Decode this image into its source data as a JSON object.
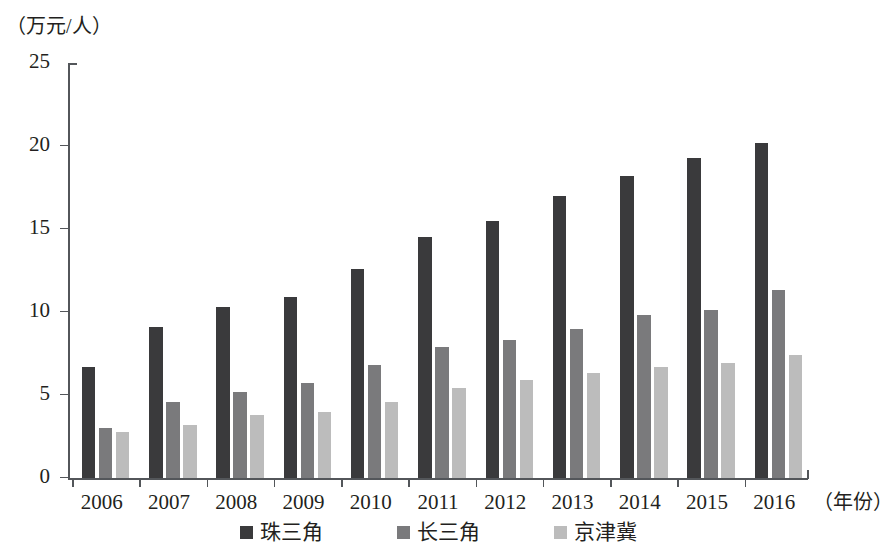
{
  "chart_data": {
    "type": "bar",
    "title": "",
    "xlabel": "（年份）",
    "ylabel": "（万元/人）",
    "categories": [
      "2006",
      "2007",
      "2008",
      "2009",
      "2010",
      "2011",
      "2012",
      "2013",
      "2014",
      "2015",
      "2016"
    ],
    "series": [
      {
        "name": "珠三角",
        "color": "#3a3a3c",
        "values": [
          6.7,
          9.1,
          10.3,
          10.9,
          12.6,
          14.5,
          15.5,
          17.0,
          18.2,
          19.3,
          20.2
        ]
      },
      {
        "name": "长三角",
        "color": "#7a7a7c",
        "values": [
          3.0,
          4.6,
          5.2,
          5.7,
          6.8,
          7.9,
          8.3,
          9.0,
          9.8,
          10.1,
          11.3
        ]
      },
      {
        "name": "京津冀",
        "color": "#bcbcbc",
        "values": [
          2.8,
          3.2,
          3.8,
          4.0,
          4.6,
          5.4,
          5.9,
          6.3,
          6.7,
          6.9,
          7.4
        ]
      }
    ],
    "yticks": [
      0,
      5,
      10,
      15,
      20,
      25
    ],
    "ylim": [
      0,
      25
    ],
    "grid": false,
    "legend_position": "bottom"
  }
}
